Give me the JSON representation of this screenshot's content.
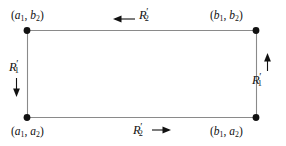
{
  "figure": {
    "type": "rectangle-boundary-orientation-diagram",
    "background_color": "#ffffff",
    "line_color": "#8a8a8a",
    "vertex_color": "#111111",
    "text_color": "#111111",
    "corners": {
      "top_left": {
        "name": "(a1, b2)",
        "x_var": "a",
        "x_sub": "1",
        "y_var": "b",
        "y_sub": "2"
      },
      "top_right": {
        "name": "(b1, b2)",
        "x_var": "b",
        "x_sub": "1",
        "y_var": "b",
        "y_sub": "2"
      },
      "bottom_left": {
        "name": "(a1, a2)",
        "x_var": "a",
        "x_sub": "1",
        "y_var": "a",
        "y_sub": "2"
      },
      "bottom_right": {
        "name": "(b1, a2)",
        "x_var": "b",
        "x_sub": "1",
        "y_var": "a",
        "y_sub": "2"
      }
    },
    "edges": {
      "top": {
        "label_base": "R",
        "label_sub": "2",
        "label_prime": "′",
        "arrow": "left-arrow-icon",
        "direction": "left"
      },
      "bottom": {
        "label_base": "R",
        "label_sub": "2",
        "label_prime": "′",
        "arrow": "right-arrow-icon",
        "direction": "right"
      },
      "left": {
        "label_base": "R",
        "label_sub": "1",
        "label_prime": "′",
        "arrow": "down-arrow-icon",
        "direction": "down"
      },
      "right": {
        "label_base": "R",
        "label_sub": "1",
        "label_prime": "′",
        "arrow": "up-arrow-icon",
        "direction": "up"
      }
    }
  }
}
